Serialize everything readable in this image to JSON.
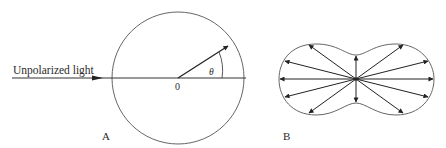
{
  "figure_a": {
    "incoming_label": "Unpolarized light",
    "origin_label": "0",
    "angle_label": "θ",
    "panel_label": "A"
  },
  "figure_b": {
    "panel_label": "B",
    "arrow_count": 12
  },
  "colors": {
    "line": "#333333",
    "circle": "#666666",
    "text": "#2a2a2a"
  }
}
